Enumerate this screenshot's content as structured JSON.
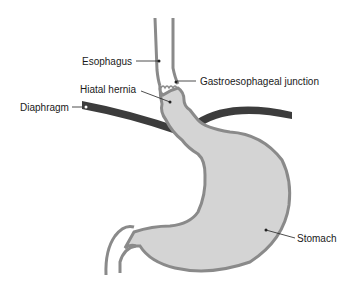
{
  "diagram": {
    "labels": {
      "esophagus": "Esophagus",
      "hiatal_hernia": "Hiatal hernia",
      "diaphragm": "Diaphragm",
      "gastroesophageal_junction": "Gastroesophageal junction",
      "stomach": "Stomach"
    },
    "colors": {
      "organ_fill": "#d4d4d4",
      "organ_outline": "#8a8a8a",
      "diaphragm": "#3c3c3c",
      "leader_line": "#222222"
    }
  }
}
